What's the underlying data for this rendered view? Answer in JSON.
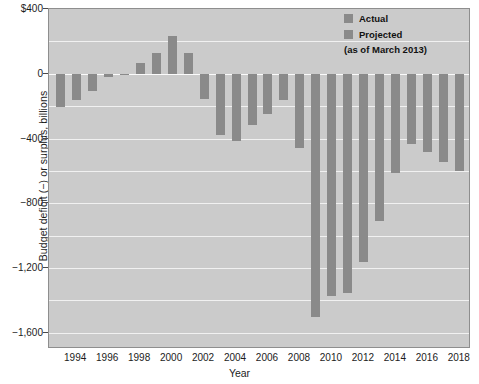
{
  "chart_data": {
    "type": "bar",
    "title": "",
    "xlabel": "Year",
    "ylabel": "Budget deficit (−) or surplus, billions",
    "ylim": [
      -1700,
      400
    ],
    "xlim": [
      1992.3,
      2018.7
    ],
    "grid": true,
    "legend_position": "top-right",
    "ytick_labels": [
      "$400",
      "0",
      "−400",
      "−800",
      "−1,200",
      "−1,600"
    ],
    "ytick_values": [
      400,
      0,
      -400,
      -800,
      -1200,
      -1600
    ],
    "xtick_labels": [
      "1994",
      "1996",
      "1998",
      "2000",
      "2002",
      "2004",
      "2006",
      "2008",
      "2010",
      "2012",
      "2014",
      "2016",
      "2018"
    ],
    "xtick_values": [
      1994,
      1996,
      1998,
      2000,
      2002,
      2004,
      2006,
      2008,
      2010,
      2012,
      2014,
      2016,
      2018
    ],
    "gridline_values": [
      200,
      0,
      -200,
      -400,
      -600,
      -800,
      -1000,
      -1200,
      -1400,
      -1600
    ],
    "series": [
      {
        "name": "Actual",
        "color": "#8a8a8a",
        "x": [
          1993,
          1994,
          1995,
          1996,
          1997,
          1998,
          1999,
          2000,
          2001,
          2002,
          2003,
          2004,
          2005,
          2006,
          2007,
          2008,
          2009,
          2010,
          2011,
          2012
        ],
        "values": [
          -203,
          -164,
          -107,
          -22,
          -8,
          69,
          126,
          236,
          128,
          -158,
          -378,
          -413,
          -318,
          -248,
          -161,
          -459,
          -1503,
          -1374,
          -1355,
          -1161
        ]
      },
      {
        "name": "Projected",
        "color": "#8a8a8a",
        "x": [
          2013,
          2014,
          2015,
          2016,
          2017,
          2018
        ],
        "values": [
          -910,
          -616,
          -432,
          -482,
          -542,
          -600
        ]
      }
    ],
    "legend": [
      {
        "label": "Actual",
        "color": "#8a8a8a"
      },
      {
        "label": "Projected",
        "color": "#8a8a8a"
      }
    ],
    "legend_note": "(as of March 2013)"
  },
  "colors": {
    "plot_background": "#cbcbcb",
    "bar": "#8a8a8a",
    "gridline": "#f1f1f1",
    "frame": "#8e8e8e",
    "text": "#1c1c1c"
  }
}
